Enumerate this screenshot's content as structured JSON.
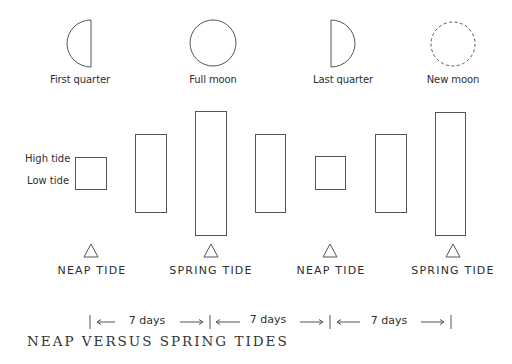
{
  "title": "NEAP VERSUS SPRING TIDES",
  "colors": {
    "stroke": "#555555",
    "text": "#2e2e2e",
    "background": "#ffffff"
  },
  "moon_phases": [
    {
      "label": "First quarter",
      "icon": "first-quarter-moon-icon",
      "cx": 80
    },
    {
      "label": "Full moon",
      "icon": "full-moon-icon",
      "cx": 213
    },
    {
      "label": "Last quarter",
      "icon": "last-quarter-moon-icon",
      "cx": 343
    },
    {
      "label": "New moon",
      "icon": "new-moon-icon",
      "cx": 453
    }
  ],
  "side_labels": {
    "high": "High tide",
    "low": "Low tide"
  },
  "tidal_range_bars": [
    {
      "x": 75,
      "top": 157,
      "bottom": 189,
      "type": "neap"
    },
    {
      "x": 135,
      "top": 134,
      "bottom": 212,
      "type": "intermediate"
    },
    {
      "x": 195,
      "top": 111,
      "bottom": 235,
      "type": "spring"
    },
    {
      "x": 255,
      "top": 134,
      "bottom": 212,
      "type": "intermediate"
    },
    {
      "x": 315,
      "top": 157,
      "bottom": 189,
      "type": "neap"
    },
    {
      "x": 375,
      "top": 134,
      "bottom": 212,
      "type": "intermediate"
    },
    {
      "x": 435,
      "top": 112,
      "bottom": 235,
      "type": "spring"
    }
  ],
  "tide_markers": [
    {
      "label": "NEAP TIDE",
      "cx": 91
    },
    {
      "label": "SPRING TIDE",
      "cx": 211
    },
    {
      "label": "NEAP TIDE",
      "cx": 330
    },
    {
      "label": "SPRING TIDE",
      "cx": 453
    }
  ],
  "timeline": {
    "ticks_x": [
      90,
      210,
      330,
      451
    ],
    "intervals": [
      {
        "label": "7 days"
      },
      {
        "label": "7 days"
      },
      {
        "label": "7 days"
      }
    ]
  }
}
